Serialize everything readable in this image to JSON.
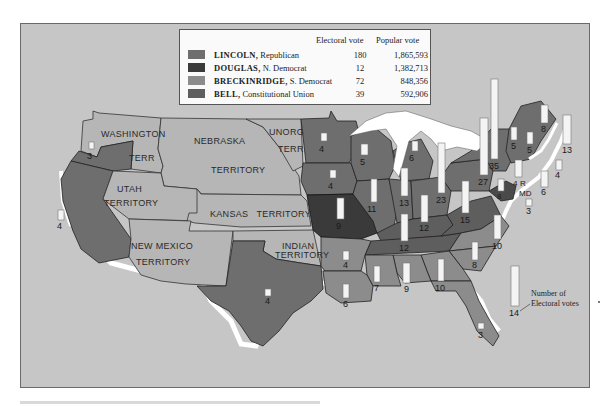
{
  "legend": {
    "header_electoral": "Electoral vote",
    "header_popular": "Popular vote",
    "candidates": [
      {
        "name": "LINCOLN,",
        "party": "Republican",
        "electoral_vote": "180",
        "popular_vote": "1,865,593",
        "color": "#6e6e6e"
      },
      {
        "name": "DOUGLAS,",
        "party": "N. Democrat",
        "electoral_vote": "12",
        "popular_vote": "1,382,713",
        "color": "#3a3a3a"
      },
      {
        "name": "BRECKINRIDGE,",
        "party": "S. Democrat",
        "electoral_vote": "72",
        "popular_vote": "848,356",
        "color": "#8c8c8c"
      },
      {
        "name": "BELL,",
        "party": "Constitutional Union",
        "electoral_vote": "39",
        "popular_vote": "592,906",
        "color": "#5e5e5e"
      }
    ]
  },
  "colors": {
    "background": "#c6c6c6",
    "territory": "#b6b6b6",
    "lincoln": "#6e6e6e",
    "douglas": "#3a3a3a",
    "breckinridge": "#8c8c8c",
    "bell": "#5e5e5e",
    "bar": "#f4f4f4",
    "water": "#ffffff"
  },
  "territories": {
    "washington": [
      "WASHINGTON",
      "TERR"
    ],
    "nebraska": [
      "NEBRASKA",
      "TERRITORY"
    ],
    "unorg": [
      "UNORG",
      "TERR"
    ],
    "utah": [
      "UTAH",
      "TERRITORY"
    ],
    "kansas": "KANSAS   TERRITORY",
    "new_mexico": [
      "NEW MEXICO",
      "TERRITORY"
    ],
    "indian": [
      "INDIAN",
      "TERRITORY"
    ]
  },
  "states": {
    "oregon": "3",
    "california": "4",
    "minnesota": "4",
    "iowa": "4",
    "missouri": "9",
    "wisconsin": "5",
    "michigan": "6",
    "illinois": "11",
    "indiana": "13",
    "ohio": "23",
    "kentucky": "12",
    "tennessee": "12",
    "pennsylvania": "27",
    "new_york": "35",
    "virginia": "15",
    "north_carolina": "10",
    "south_carolina": "8",
    "georgia": "10",
    "alabama": "9",
    "mississippi": "7",
    "louisiana": "6",
    "arkansas": "4",
    "texas": "4",
    "florida": "3",
    "vermont": "5",
    "new_hampshire": "5",
    "maine": "8",
    "massachusetts": "13",
    "rhode_island": "4",
    "connecticut": "6",
    "new_jersey": "4",
    "delaware": "3",
    "maryland": "8",
    "ri_label": "R",
    "md_label": "MD"
  },
  "annotation": {
    "sample_value": "14",
    "line1": "Number of",
    "line2": "Electoral votes"
  }
}
